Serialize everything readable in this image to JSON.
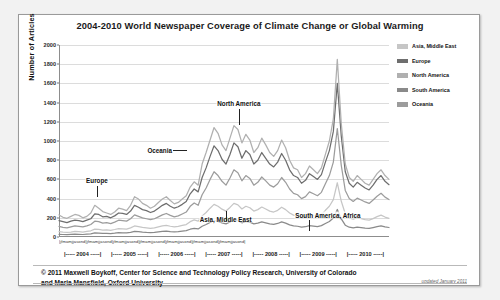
{
  "chart_data": {
    "type": "line",
    "title": "2004-2010 World Newspaper Coverage of Climate Change or Global Warming",
    "xlabel": "",
    "ylabel": "Number of Articles",
    "ylim": [
      0,
      2000
    ],
    "ytick_step": 200,
    "yticks": [
      "2000",
      "1800",
      "1600",
      "1400",
      "1200",
      "1000",
      "800",
      "600",
      "400",
      "200",
      "0"
    ],
    "grid": true,
    "legend_position": "right",
    "months_row": "j f m a m j j a s o n d",
    "years": [
      "2004",
      "2005",
      "2006",
      "2007",
      "2008",
      "2009",
      "2010"
    ],
    "x_start": "January 2004",
    "x_end": "December 2010",
    "annotations": [
      {
        "label": "North America",
        "x_pos": 0.545,
        "y_pos": 0.3
      },
      {
        "label": "Oceania",
        "x_pos": 0.305,
        "y_pos": 0.545
      },
      {
        "label": "Europe",
        "x_pos": 0.115,
        "y_pos": 0.705
      },
      {
        "label": "Asia, Middle East",
        "x_pos": 0.505,
        "y_pos": 0.905
      },
      {
        "label": "South America, Africa",
        "x_pos": 0.815,
        "y_pos": 0.885
      }
    ],
    "legend": [
      {
        "name": "Asia, Middle East",
        "color": "#c6c6c6"
      },
      {
        "name": "Europe",
        "color": "#6e6e6e"
      },
      {
        "name": "North America",
        "color": "#b0b0b0"
      },
      {
        "name": "South America",
        "color": "#8a8a8a"
      },
      {
        "name": "Oceania",
        "color": "#9c9c9c"
      }
    ],
    "series": [
      {
        "name": "North America",
        "color": "#b0b0b0",
        "values": [
          230,
          205,
          195,
          215,
          235,
          225,
          200,
          215,
          250,
          330,
          300,
          265,
          250,
          235,
          260,
          300,
          290,
          275,
          330,
          420,
          395,
          350,
          330,
          300,
          320,
          360,
          395,
          420,
          380,
          345,
          360,
          395,
          430,
          520,
          575,
          540,
          760,
          880,
          1010,
          1140,
          1080,
          960,
          900,
          1030,
          1160,
          1120,
          980,
          1070,
          1010,
          880,
          930,
          1030,
          960,
          880,
          840,
          900,
          1010,
          930,
          800,
          720,
          700,
          620,
          660,
          740,
          700,
          660,
          720,
          860,
          1000,
          1230,
          1850,
          1180,
          760,
          620,
          580,
          640,
          600,
          560,
          540,
          600,
          660,
          700,
          640,
          600
        ]
      },
      {
        "name": "Europe",
        "color": "#6e6e6e",
        "values": [
          170,
          160,
          150,
          165,
          175,
          170,
          160,
          175,
          190,
          240,
          235,
          210,
          215,
          200,
          220,
          250,
          245,
          235,
          270,
          330,
          310,
          285,
          275,
          255,
          270,
          300,
          330,
          350,
          320,
          300,
          315,
          340,
          370,
          450,
          500,
          470,
          620,
          720,
          840,
          950,
          900,
          810,
          760,
          860,
          980,
          940,
          820,
          900,
          860,
          760,
          800,
          880,
          820,
          760,
          730,
          780,
          870,
          800,
          700,
          640,
          620,
          560,
          590,
          660,
          630,
          600,
          650,
          780,
          900,
          1100,
          1600,
          1050,
          680,
          560,
          520,
          570,
          540,
          510,
          490,
          540,
          600,
          640,
          580,
          545
        ]
      },
      {
        "name": "Oceania",
        "color": "#9c9c9c",
        "values": [
          110,
          100,
          95,
          105,
          115,
          110,
          105,
          115,
          130,
          165,
          160,
          145,
          150,
          140,
          155,
          175,
          170,
          165,
          190,
          230,
          215,
          200,
          190,
          180,
          190,
          210,
          230,
          245,
          225,
          210,
          220,
          240,
          260,
          320,
          355,
          330,
          440,
          510,
          600,
          680,
          640,
          580,
          540,
          615,
          700,
          670,
          585,
          640,
          610,
          540,
          570,
          625,
          585,
          540,
          520,
          555,
          620,
          570,
          500,
          455,
          440,
          400,
          420,
          470,
          450,
          430,
          465,
          555,
          640,
          780,
          1130,
          745,
          485,
          400,
          370,
          405,
          385,
          365,
          350,
          385,
          425,
          455,
          415,
          390
        ]
      },
      {
        "name": "Asia, Middle East",
        "color": "#c6c6c6",
        "values": [
          55,
          50,
          48,
          52,
          58,
          55,
          52,
          58,
          65,
          82,
          80,
          72,
          75,
          70,
          78,
          88,
          85,
          82,
          95,
          115,
          108,
          100,
          95,
          90,
          95,
          105,
          115,
          122,
          112,
          105,
          110,
          120,
          130,
          160,
          178,
          165,
          220,
          255,
          300,
          340,
          320,
          290,
          270,
          308,
          350,
          335,
          292,
          320,
          305,
          270,
          285,
          312,
          292,
          270,
          260,
          278,
          310,
          285,
          250,
          228,
          220,
          200,
          210,
          235,
          225,
          215,
          232,
          278,
          320,
          390,
          565,
          372,
          242,
          200,
          185,
          202,
          192,
          182,
          175,
          192,
          212,
          228,
          208,
          195
        ]
      },
      {
        "name": "South America, Africa",
        "color": "#8a8a8a",
        "values": [
          28,
          26,
          24,
          27,
          30,
          28,
          26,
          30,
          33,
          42,
          40,
          37,
          38,
          36,
          40,
          45,
          43,
          42,
          48,
          58,
          55,
          51,
          48,
          46,
          48,
          53,
          58,
          62,
          57,
          53,
          56,
          61,
          66,
          81,
          90,
          84,
          112,
          130,
          152,
          172,
          162,
          147,
          137,
          156,
          177,
          170,
          148,
          162,
          155,
          137,
          145,
          158,
          148,
          137,
          132,
          141,
          157,
          145,
          127,
          116,
          112,
          102,
          107,
          119,
          114,
          109,
          118,
          141,
          162,
          198,
          287,
          189,
          123,
          102,
          94,
          103,
          98,
          92,
          89,
          98,
          108,
          116,
          106,
          99
        ]
      }
    ]
  },
  "footer": {
    "credit_line1": "© 2011 Maxwell Boykoff, Center for Science and Technology Policy Research, University of Colorado",
    "credit_line2": "and Maria Mansfield, Oxford University",
    "updated": "updated January 2011"
  }
}
